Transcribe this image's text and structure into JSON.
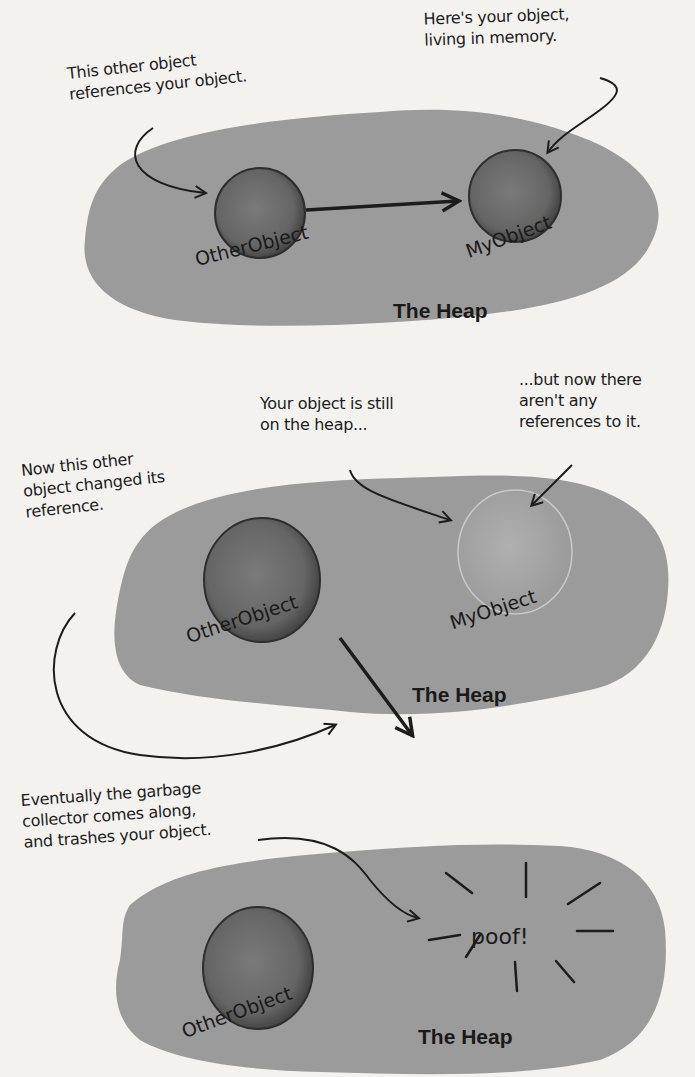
{
  "diagram": {
    "colors": {
      "page": "#f3f2ef",
      "heap": "#9b9b9b",
      "object": "#6b6b6b",
      "object_rim": "#2e2e2e",
      "ghost_object": "#a9a9a9",
      "ink": "#1c1c1c"
    },
    "panels": [
      {
        "heap_label": "The Heap",
        "objects": [
          {
            "name": "OtherObject",
            "state": "live"
          },
          {
            "name": "MyObject",
            "state": "live"
          }
        ],
        "references": [
          {
            "from": "OtherObject",
            "to": "MyObject"
          }
        ],
        "notes": [
          {
            "text": "This other object\nreferences your object.",
            "points_to": "OtherObject"
          },
          {
            "text": "Here's your object,\nliving in memory.",
            "points_to": "MyObject"
          }
        ]
      },
      {
        "heap_label": "The Heap",
        "objects": [
          {
            "name": "OtherObject",
            "state": "live"
          },
          {
            "name": "MyObject",
            "state": "unreferenced"
          }
        ],
        "references": [
          {
            "from": "OtherObject",
            "to": "elsewhere"
          }
        ],
        "notes": [
          {
            "text": "Your object is still\non the heap...",
            "points_to": "MyObject"
          },
          {
            "text": "...but now there\naren't any\nreferences to it.",
            "points_to": "MyObject"
          },
          {
            "text": "Now this other\nobject changed its\nreference.",
            "points_to": "OtherObject reference arrow"
          }
        ]
      },
      {
        "heap_label": "The Heap",
        "objects": [
          {
            "name": "OtherObject",
            "state": "live"
          }
        ],
        "references": [],
        "effect": "poof!",
        "notes": [
          {
            "text": "Eventually the garbage\ncollector comes along,\nand trashes your object.",
            "points_to": "poof!"
          }
        ]
      }
    ]
  }
}
